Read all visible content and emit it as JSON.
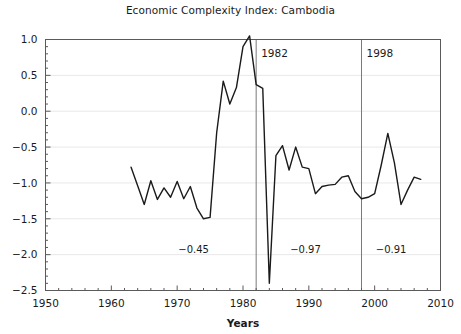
{
  "chart_data": {
    "type": "line",
    "title": "Economic Complexity Index: Cambodia",
    "xlabel": "Years",
    "ylabel": "",
    "xlim": [
      1950,
      2010
    ],
    "ylim": [
      -2.5,
      1.0
    ],
    "grid": true,
    "legend": "none",
    "xticks": [
      1950,
      1960,
      1970,
      1980,
      1990,
      2000,
      2010
    ],
    "xtick_labels": [
      "1950",
      "1960",
      "1970",
      "1980",
      "1990",
      "2000",
      "2010"
    ],
    "yticks": [
      1.0,
      0.5,
      0.0,
      -0.5,
      -1.0,
      -1.5,
      -2.0,
      -2.5
    ],
    "ytick_labels": [
      "1.0",
      "0.5",
      "0.0",
      "-0.5",
      "-1.0",
      "-1.5",
      "-2.0",
      "-2.5"
    ],
    "x_minor_tick_interval": 2,
    "y_minor_tick_interval": 0.1,
    "series": [
      {
        "name": "Economic Complexity Index",
        "color": "#1a1a1a",
        "x": [
          1963,
          1964,
          1965,
          1966,
          1967,
          1968,
          1969,
          1970,
          1971,
          1972,
          1973,
          1974,
          1975,
          1976,
          1977,
          1978,
          1979,
          1980,
          1981,
          1982,
          1983,
          1984,
          1985,
          1986,
          1987,
          1988,
          1989,
          1990,
          1991,
          1992,
          1993,
          1994,
          1995,
          1996,
          1997,
          1998,
          1999,
          2000,
          2001,
          2002,
          2003,
          2004,
          2005,
          2006,
          2007
        ],
        "y": [
          -0.78,
          -1.04,
          -1.3,
          -0.97,
          -1.23,
          -1.07,
          -1.2,
          -0.98,
          -1.22,
          -1.05,
          -1.35,
          -1.5,
          -1.48,
          -0.3,
          0.42,
          0.1,
          0.33,
          0.9,
          1.05,
          0.37,
          0.32,
          -2.4,
          -0.62,
          -0.48,
          -0.82,
          -0.5,
          -0.78,
          -0.8,
          -1.15,
          -1.05,
          -1.03,
          -1.02,
          -0.92,
          -0.9,
          -1.12,
          -1.22,
          -1.2,
          -1.15,
          -0.75,
          -0.31,
          -0.72,
          -1.3,
          -1.1,
          -0.92,
          -0.95
        ]
      }
    ],
    "vertical_markers": [
      {
        "x": 1982,
        "label": "1982"
      },
      {
        "x": 1998,
        "label": "1998"
      }
    ],
    "annotations": [
      {
        "text": "-0.45",
        "x": 1972.5,
        "y": -1.98,
        "meaning": "period-mean-before-1982"
      },
      {
        "text": "-0.97",
        "x": 1989.5,
        "y": -1.98,
        "meaning": "period-mean-1982-1998"
      },
      {
        "text": "-0.91",
        "x": 2002.5,
        "y": -1.98,
        "meaning": "period-mean-after-1998"
      }
    ]
  },
  "style": {
    "line_color": "#1a1a1a",
    "grid_color": "#e8e8e8",
    "axis_color": "#5a5a5a",
    "marker_line_color": "#7a7a7a",
    "background": "#ffffff"
  }
}
